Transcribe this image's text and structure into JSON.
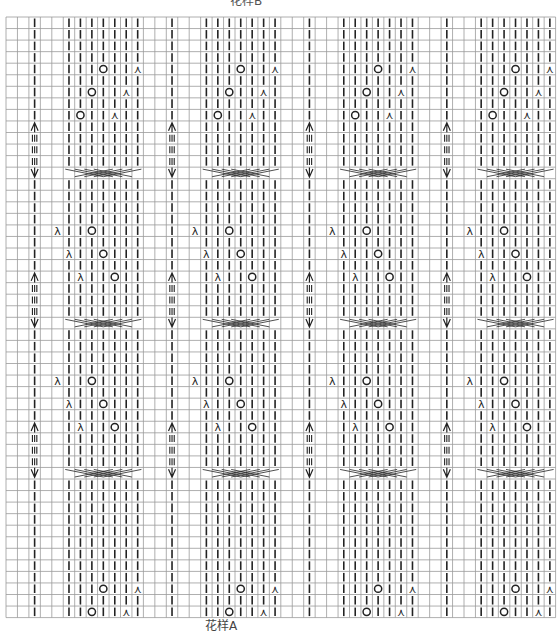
{
  "labels": {
    "top": "花样B",
    "bottom": "花样A"
  },
  "grid": {
    "left": 6,
    "top": 17,
    "cols": 48,
    "rows": 52,
    "cell_w": 11.45,
    "cell_h": 11.55,
    "line_color": "#9a9a9a",
    "symbol_color": "#222222",
    "repeat_cols": 12,
    "repeats": 4
  },
  "legend_symbols": {
    "|": "knit",
    "O": "yarn-over",
    "λ": "left-leaning decrease",
    "⋏": "right-leaning decrease",
    "III": "cable column",
    "arrow": "cable top",
    "V": "cable bottom",
    "X": "cable cross (7 sts)"
  },
  "block_pattern": {
    "knit_cols": [
      2,
      5,
      6,
      7,
      8,
      9,
      10,
      11
    ],
    "cable_col": 2,
    "cross_cols": [
      5,
      11
    ],
    "bands": [
      {
        "start_row": 0,
        "type": "A",
        "blocks": [
          0,
          1,
          2,
          3
        ]
      },
      {
        "start_row": 13,
        "type": "B",
        "blocks": [
          0,
          1,
          2,
          3
        ]
      },
      {
        "start_row": 26,
        "type": "C",
        "blocks": [
          0,
          1,
          2,
          3
        ]
      },
      {
        "start_row": 39,
        "type": "A2",
        "blocks": [
          0,
          1,
          2,
          3
        ]
      }
    ],
    "band_A_ops": [
      {
        "row": 4,
        "O": 8,
        "dec": 11,
        "dec_sym": "⋏"
      },
      {
        "row": 6,
        "O": 7,
        "dec": 10,
        "dec_sym": "⋏"
      },
      {
        "row": 8,
        "O": 6,
        "dec": 9,
        "dec_sym": "⋏"
      }
    ],
    "band_B_ops": [
      {
        "row": 18,
        "dec": 4,
        "O": 7,
        "dec_sym": "λ"
      },
      {
        "row": 20,
        "dec": 5,
        "O": 8,
        "dec_sym": "λ"
      },
      {
        "row": 22,
        "dec": 6,
        "O": 9,
        "dec_sym": "λ"
      }
    ],
    "cable_rows": [
      {
        "arrow": 9,
        "bars": [
          10,
          11,
          12
        ],
        "v": 13,
        "cross": 13
      },
      {
        "arrow": 22,
        "bars": [
          23,
          24,
          25
        ],
        "v": 26,
        "cross": 26
      },
      {
        "arrow": 35,
        "bars": [
          36,
          37,
          38
        ],
        "v": 39,
        "cross": 39
      }
    ]
  }
}
